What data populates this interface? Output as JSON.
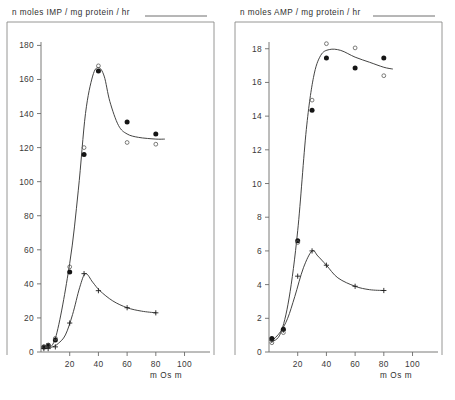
{
  "figure": {
    "background": "#ffffff",
    "ink_color": "#3a3a39",
    "panel_count": 2
  },
  "panels": {
    "left": {
      "y_axis_title": "n moles  IMP / mg  protein / hr",
      "x_axis_label": "m Os m",
      "y_ticks": [
        "0",
        "20",
        "40",
        "60",
        "80",
        "100",
        "120",
        "140",
        "160",
        "180"
      ],
      "x_ticks": [
        "20",
        "40",
        "60",
        "80",
        "100"
      ]
    },
    "right": {
      "y_axis_title": "n moles  AMP / mg  protein / hr",
      "x_axis_label": "m Os m",
      "y_ticks": [
        "0",
        "2",
        "4",
        "6",
        "8",
        "10",
        "12",
        "14",
        "16",
        "18"
      ],
      "x_ticks": [
        "20",
        "40",
        "60",
        "80",
        "100"
      ]
    }
  },
  "chart_data": [
    {
      "type": "scatter",
      "panel": "left",
      "title": "n moles  IMP / mg  protein / hr",
      "xlabel": "m Os m",
      "ylabel": "n moles  IMP / mg  protein / hr",
      "xlim": [
        0,
        108
      ],
      "ylim": [
        0,
        182
      ],
      "xticks": [
        20,
        40,
        60,
        80,
        100
      ],
      "yticks": [
        0,
        20,
        40,
        60,
        80,
        100,
        120,
        140,
        160,
        180
      ],
      "grid": false,
      "legend": "none",
      "series": [
        {
          "name": "IMP upper - filled circles",
          "marker": "filled-circle",
          "x": [
            2,
            5,
            10,
            20,
            30,
            40,
            60,
            80
          ],
          "y": [
            3,
            4,
            7,
            47,
            116,
            165,
            135,
            128
          ]
        },
        {
          "name": "IMP upper - open circles",
          "marker": "open-circle",
          "x": [
            2,
            5,
            10,
            20,
            30,
            40,
            60,
            80
          ],
          "y": [
            3,
            4,
            8,
            50,
            120,
            168,
            123,
            122
          ]
        },
        {
          "name": "IMP lower - crosses",
          "marker": "cross",
          "x": [
            2,
            5,
            10,
            20,
            30,
            40,
            60,
            80
          ],
          "y": [
            2,
            2,
            3,
            17,
            46,
            36,
            26,
            23
          ]
        }
      ],
      "fitted_curves": [
        {
          "name": "upper fit",
          "x": [
            2,
            10,
            20,
            26,
            31,
            36,
            40,
            44,
            48,
            54,
            60,
            68,
            80,
            86
          ],
          "y": [
            3,
            8,
            52,
            95,
            140,
            162,
            167,
            162,
            147,
            133,
            128,
            126,
            125,
            125
          ]
        },
        {
          "name": "lower fit",
          "x": [
            2,
            8,
            12,
            17,
            22,
            27,
            31,
            36,
            41,
            50,
            60,
            70,
            80
          ],
          "y": [
            2,
            3,
            5,
            10,
            22,
            38,
            46,
            41,
            36,
            30,
            26,
            24,
            23
          ]
        }
      ]
    },
    {
      "type": "scatter",
      "panel": "right",
      "title": "n moles  AMP / mg  protein / hr",
      "xlabel": "m Os m",
      "ylabel": "n moles  AMP / mg  protein / hr",
      "xlim": [
        0,
        108
      ],
      "ylim": [
        0,
        18.4
      ],
      "xticks": [
        20,
        40,
        60,
        80,
        100
      ],
      "yticks": [
        0,
        2,
        4,
        6,
        8,
        10,
        12,
        14,
        16,
        18
      ],
      "grid": false,
      "legend": "none",
      "series": [
        {
          "name": "AMP upper - filled circles",
          "marker": "filled-circle",
          "x": [
            2,
            10,
            20,
            30,
            40,
            60,
            80
          ],
          "y": [
            0.8,
            1.35,
            6.6,
            14.35,
            17.45,
            16.85,
            17.45
          ]
        },
        {
          "name": "AMP upper - open circles",
          "marker": "open-circle",
          "x": [
            2,
            10,
            20,
            30,
            40,
            60,
            80
          ],
          "y": [
            0.55,
            1.15,
            6.5,
            14.95,
            18.3,
            18.05,
            16.4
          ]
        },
        {
          "name": "AMP lower - crosses",
          "marker": "cross",
          "x": [
            2,
            10,
            20,
            30,
            40,
            60,
            80
          ],
          "y": [
            0.7,
            1.3,
            4.5,
            6.0,
            5.15,
            3.9,
            3.65
          ]
        }
      ],
      "fitted_curves": [
        {
          "name": "upper fit",
          "x": [
            2,
            8,
            14,
            20,
            26,
            31,
            36,
            42,
            50,
            60,
            70,
            80,
            86
          ],
          "y": [
            0.6,
            1.1,
            3.2,
            7.2,
            13.2,
            16.3,
            17.6,
            17.95,
            17.9,
            17.5,
            17.2,
            16.9,
            16.8
          ]
        },
        {
          "name": "lower fit",
          "x": [
            2,
            8,
            13,
            18,
            24,
            30,
            34,
            40,
            48,
            60,
            70,
            80
          ],
          "y": [
            0.65,
            1.2,
            2.0,
            3.3,
            5.0,
            6.0,
            5.7,
            5.15,
            4.4,
            3.9,
            3.7,
            3.65
          ]
        }
      ]
    }
  ]
}
